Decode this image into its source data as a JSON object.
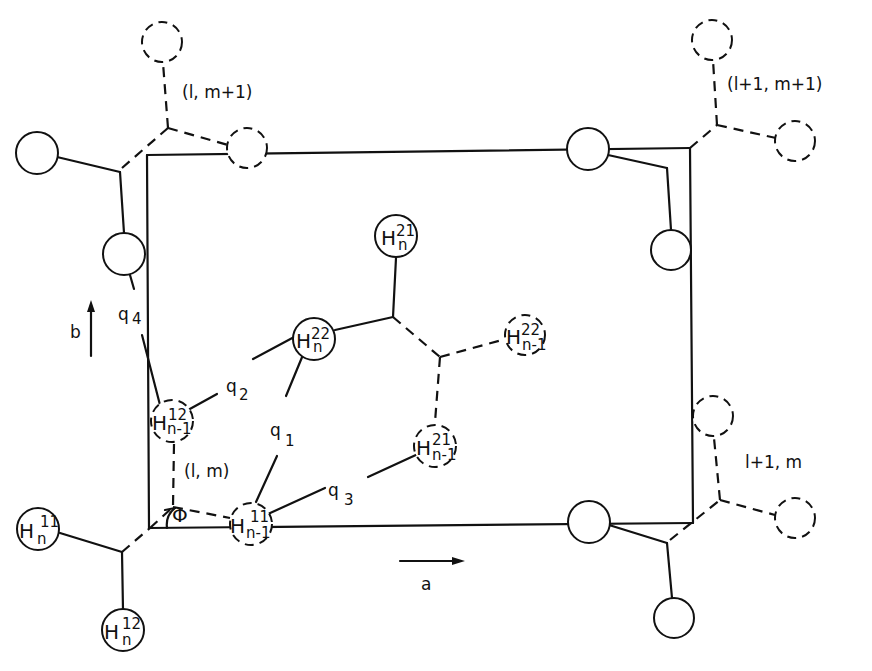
{
  "diagram": {
    "cell_labels": {
      "lm": "(l, m)",
      "lm1": "(l, m+1)",
      "l1m1": "(l+1, m+1)",
      "l1m": "l+1, m"
    },
    "axes": {
      "a": "a",
      "b": "b"
    },
    "distances": {
      "q1": {
        "base": "q",
        "sub": "1"
      },
      "q2": {
        "base": "q",
        "sub": "2"
      },
      "q3": {
        "base": "q",
        "sub": "3"
      },
      "q4": {
        "base": "q",
        "sub": "4"
      }
    },
    "angle": "Φ",
    "atoms": {
      "Hn21": {
        "sym": "H",
        "sup": "21",
        "sub": "n"
      },
      "Hn22": {
        "sym": "H",
        "sup": "22",
        "sub": "n"
      },
      "Hn1_22": {
        "sym": "H",
        "sup": "22",
        "sub": "n-1"
      },
      "Hn1_21": {
        "sym": "H",
        "sup": "21",
        "sub": "n-1"
      },
      "Hn1_12": {
        "sym": "H",
        "sup": "12",
        "sub": "n-1"
      },
      "Hn1_11": {
        "sym": "H",
        "sup": "11",
        "sub": "n-1"
      },
      "Hn11": {
        "sym": "H",
        "sup": "11",
        "sub": "n"
      },
      "Hn12": {
        "sym": "H",
        "sup": "12",
        "sub": "n"
      }
    }
  }
}
